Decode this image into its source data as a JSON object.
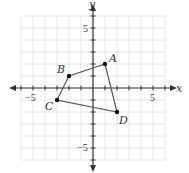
{
  "figure": {
    "axis_labels": {
      "x": "x",
      "y": "y"
    },
    "tick_labels": {
      "x_neg": "−5",
      "x_pos": "5",
      "y_pos": "5",
      "y_neg": "−5"
    },
    "x_range": [
      -6,
      6
    ],
    "y_range": [
      -6,
      6
    ],
    "polygon": [
      {
        "label": "A",
        "x": 1,
        "y": 2
      },
      {
        "label": "D",
        "x": 2,
        "y": -2
      },
      {
        "label": "C",
        "x": -3,
        "y": -1
      },
      {
        "label": "B",
        "x": -2,
        "y": 1
      }
    ],
    "colors": {
      "grid": "#e0e0e0",
      "axis": "#333333",
      "polygon": "#555555"
    }
  }
}
